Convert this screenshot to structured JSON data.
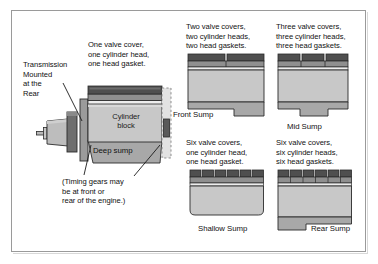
{
  "figure": {
    "background_color": "#ffffff",
    "border_color": "#9a9a9a"
  },
  "palette": {
    "valve_cover": "#555555",
    "valve_cover_dark": "#3f3f3f",
    "cylinder_head": "#8d8d8d",
    "head_gasket": "#e8e8e8",
    "block": "#c3c3c3",
    "block_light": "#cfcfcf",
    "sump": "#a6a6a6",
    "bellhousing": "#6b6b6b",
    "transmission": "#b5b5b5",
    "outline": "#2b2b2b",
    "text": "#111111"
  },
  "engine_main": {
    "callout_transmission": "Transmission\nMounted\nat the\nRear",
    "caption_top": "One valve cover,\none cylinder head,\none head gasket.",
    "label_block": "Cylinder\nblock",
    "label_sump": "Deep sump",
    "note_timing": "(Timing gears may\nbe at front or\nrear of the engine.)"
  },
  "variants": [
    {
      "id": "front-sump",
      "caption": "Two valve covers,\ntwo cylinder heads,\ntwo head gaskets.",
      "sump_label": "Front Sump",
      "valve_cover_count": 2,
      "sump_position": "right"
    },
    {
      "id": "mid-sump",
      "caption": "Three valve covers,\nthree cylinder heads,\nthree head gaskets.",
      "sump_label": "Mid Sump",
      "valve_cover_count": 3,
      "sump_position": "center"
    },
    {
      "id": "shallow-sump",
      "caption": "Six valve covers,\none cylinder head,\none head gasket.",
      "sump_label": "Shallow Sump",
      "valve_cover_count": 6,
      "sump_position": "none"
    },
    {
      "id": "rear-sump",
      "caption": "Six valve covers,\nsix cylinder heads,\nsix head gaskets.",
      "sump_label": "Rear Sump",
      "valve_cover_count": 6,
      "sump_position": "left"
    }
  ]
}
